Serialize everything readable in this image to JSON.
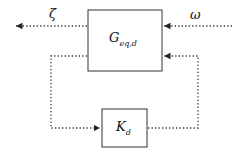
{
  "diagram": {
    "type": "block-diagram",
    "blocks": [
      {
        "id": "plant",
        "label_main": "G",
        "label_sub": "eq,d"
      },
      {
        "id": "controller",
        "label_main": "K",
        "label_sub": "d"
      }
    ],
    "signals": {
      "output": "ζ",
      "input": "ω"
    },
    "connections": [
      {
        "from": "plant",
        "to": "output",
        "label": "ζ"
      },
      {
        "from": "input",
        "to": "plant",
        "label": "ω"
      },
      {
        "from": "plant",
        "to": "controller",
        "path": "left loop"
      },
      {
        "from": "controller",
        "to": "plant",
        "path": "right loop"
      }
    ],
    "line_style": "dotted",
    "colors": {
      "stroke": "#333333",
      "background": "#ffffff"
    }
  }
}
